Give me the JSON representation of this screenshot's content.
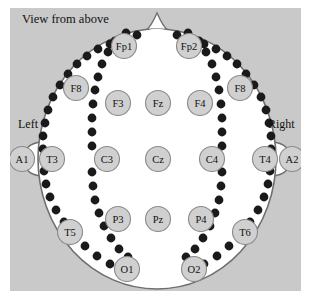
{
  "figure": {
    "title_note": "View from above",
    "left_label": "Left",
    "right_label": "Right",
    "background_color": "#c9c9c9",
    "head_fill": "#ffffff",
    "head_stroke": "#6f6f6f",
    "electrode_fill": "#d0d0d0",
    "electrode_stroke": "#8a8a8a",
    "dot_color": "#1a1a1a"
  },
  "chart_data": {
    "type": "scatter",
    "title": "View from above",
    "xlabel": "",
    "ylabel": "",
    "xlim": [
      0,
      315
    ],
    "ylim": [
      0,
      303
    ],
    "grid": false,
    "legend": null,
    "annotations": [
      "View from above",
      "Left",
      "Right"
    ],
    "categories": [
      "Fp1",
      "Fp2",
      "F8",
      "F8",
      "F3",
      "Fz",
      "F4",
      "A1",
      "T3",
      "C3",
      "Cz",
      "C4",
      "T4",
      "A2",
      "P3",
      "Pz",
      "P4",
      "T5",
      "T6",
      "O1",
      "O2"
    ],
    "series": [
      {
        "name": "electrodes",
        "points": [
          {
            "label": "Fp1",
            "x": 124,
            "y": 46,
            "r": 12.5
          },
          {
            "label": "Fp2",
            "x": 189,
            "y": 46,
            "r": 12.5
          },
          {
            "label": "F8",
            "x": 76,
            "y": 88,
            "r": 12.5
          },
          {
            "label": "F8",
            "x": 240,
            "y": 88,
            "r": 12.5
          },
          {
            "label": "F3",
            "x": 118,
            "y": 103,
            "r": 12.5
          },
          {
            "label": "Fz",
            "x": 158,
            "y": 103,
            "r": 12.5
          },
          {
            "label": "F4",
            "x": 200,
            "y": 103,
            "r": 12.5
          },
          {
            "label": "A1",
            "x": 22,
            "y": 159,
            "r": 12.5
          },
          {
            "label": "T3",
            "x": 52,
            "y": 159,
            "r": 12.5
          },
          {
            "label": "C3",
            "x": 107,
            "y": 159,
            "r": 12.5
          },
          {
            "label": "Cz",
            "x": 158,
            "y": 159,
            "r": 12.5
          },
          {
            "label": "C4",
            "x": 212,
            "y": 159,
            "r": 12.5
          },
          {
            "label": "T4",
            "x": 265,
            "y": 159,
            "r": 12.5
          },
          {
            "label": "A2",
            "x": 292,
            "y": 159,
            "r": 12.5
          },
          {
            "label": "P3",
            "x": 118,
            "y": 219,
            "r": 12.5
          },
          {
            "label": "Pz",
            "x": 158,
            "y": 219,
            "r": 12.5
          },
          {
            "label": "P4",
            "x": 201,
            "y": 219,
            "r": 12.5
          },
          {
            "label": "T5",
            "x": 70,
            "y": 232,
            "r": 12.5
          },
          {
            "label": "T6",
            "x": 245,
            "y": 232,
            "r": 12.5
          },
          {
            "label": "O1",
            "x": 127,
            "y": 269,
            "r": 12.5
          },
          {
            "label": "O2",
            "x": 194,
            "y": 269,
            "r": 12.5
          }
        ]
      }
    ]
  }
}
